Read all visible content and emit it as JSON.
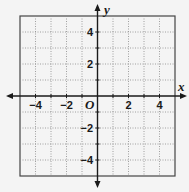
{
  "diagram": {
    "type": "coordinate-plane",
    "x_axis_label": "x",
    "y_axis_label": "y",
    "origin_label": "O",
    "x_range": [
      -5,
      5
    ],
    "y_range": [
      -5,
      5
    ],
    "grid_step": 1,
    "x_tick_labels": [
      "−4",
      "−2",
      "2",
      "4"
    ],
    "y_tick_labels": [
      "4",
      "2",
      "−2",
      "−4"
    ],
    "colors": {
      "axis": "#1a1a1a",
      "grid": "#8a8a8a",
      "background": "#f4f4f4"
    }
  }
}
